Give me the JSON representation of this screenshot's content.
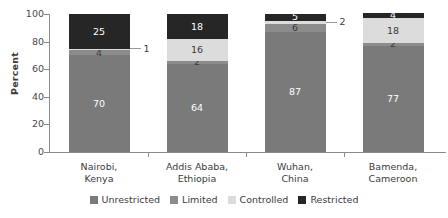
{
  "chart_data": {
    "type": "bar",
    "subtype": "stacked-100-percent",
    "title": "",
    "xlabel": "",
    "ylabel": "Percent",
    "ylim": [
      0,
      100
    ],
    "yticks": [
      0,
      20,
      40,
      60,
      80,
      100
    ],
    "grid": false,
    "legend_position": "bottom",
    "categories": [
      "Nairobi, Kenya",
      "Addis Ababa, Ethiopia",
      "Wuhan, China",
      "Bamenda, Cameroon"
    ],
    "category_lines": [
      [
        "Nairobi,",
        "Kenya"
      ],
      [
        "Addis Ababa,",
        "Ethiopia"
      ],
      [
        "Wuhan,",
        "China"
      ],
      [
        "Bamenda,",
        "Cameroon"
      ]
    ],
    "series": [
      {
        "name": "Unrestricted",
        "color": "#7a7a7a",
        "values": [
          70,
          64,
          87,
          77
        ]
      },
      {
        "name": "Limited",
        "color": "#8c8c8c",
        "values": [
          4,
          2,
          6,
          2
        ]
      },
      {
        "name": "Controlled",
        "color": "#dcdcdc",
        "values": [
          1,
          16,
          2,
          18
        ]
      },
      {
        "name": "Restricted",
        "color": "#262626",
        "values": [
          25,
          18,
          5,
          4
        ]
      }
    ]
  },
  "axis": {
    "y_title": "Percent",
    "y_ticks": [
      "0",
      "20",
      "40",
      "60",
      "80",
      "100"
    ]
  },
  "bars": [
    {
      "category_line1": "Nairobi,",
      "category_line2": "Kenya",
      "segments": [
        {
          "series": "Unrestricted",
          "value": 70,
          "label": "70",
          "label_style": "light",
          "label_mode": "inside"
        },
        {
          "series": "Limited",
          "value": 4,
          "label": "4",
          "label_style": "dark",
          "label_mode": "inside"
        },
        {
          "series": "Controlled",
          "value": 1,
          "label": "1",
          "label_style": "dark",
          "label_mode": "callout"
        },
        {
          "series": "Restricted",
          "value": 25,
          "label": "25",
          "label_style": "light",
          "label_mode": "inside"
        }
      ]
    },
    {
      "category_line1": "Addis Ababa,",
      "category_line2": "Ethiopia",
      "segments": [
        {
          "series": "Unrestricted",
          "value": 64,
          "label": "64",
          "label_style": "light",
          "label_mode": "inside"
        },
        {
          "series": "Limited",
          "value": 2,
          "label": "2",
          "label_style": "dark",
          "label_mode": "inside"
        },
        {
          "series": "Controlled",
          "value": 16,
          "label": "16",
          "label_style": "dark",
          "label_mode": "inside"
        },
        {
          "series": "Restricted",
          "value": 18,
          "label": "18",
          "label_style": "light",
          "label_mode": "inside"
        }
      ]
    },
    {
      "category_line1": "Wuhan,",
      "category_line2": "China",
      "segments": [
        {
          "series": "Unrestricted",
          "value": 87,
          "label": "87",
          "label_style": "light",
          "label_mode": "inside"
        },
        {
          "series": "Limited",
          "value": 6,
          "label": "6",
          "label_style": "dark",
          "label_mode": "inside"
        },
        {
          "series": "Controlled",
          "value": 2,
          "label": "2",
          "label_style": "dark",
          "label_mode": "callout"
        },
        {
          "series": "Restricted",
          "value": 5,
          "label": "5",
          "label_style": "light",
          "label_mode": "inside"
        }
      ]
    },
    {
      "category_line1": "Bamenda,",
      "category_line2": "Cameroon",
      "segments": [
        {
          "series": "Unrestricted",
          "value": 77,
          "label": "77",
          "label_style": "light",
          "label_mode": "inside"
        },
        {
          "series": "Limited",
          "value": 2,
          "label": "2",
          "label_style": "dark",
          "label_mode": "inside"
        },
        {
          "series": "Controlled",
          "value": 18,
          "label": "18",
          "label_style": "dark",
          "label_mode": "inside"
        },
        {
          "series": "Restricted",
          "value": 4,
          "label": "4",
          "label_style": "light",
          "label_mode": "inside"
        }
      ]
    }
  ],
  "legend": {
    "items": [
      {
        "label": "Unrestricted",
        "color": "#7a7a7a"
      },
      {
        "label": "Limited",
        "color": "#8c8c8c"
      },
      {
        "label": "Controlled",
        "color": "#dcdcdc"
      },
      {
        "label": "Restricted",
        "color": "#262626"
      }
    ]
  },
  "colors": {
    "axis": "#8c8c8c",
    "text": "#3b3b3b",
    "background": "#ffffff",
    "leader": "#9a9a9a"
  }
}
